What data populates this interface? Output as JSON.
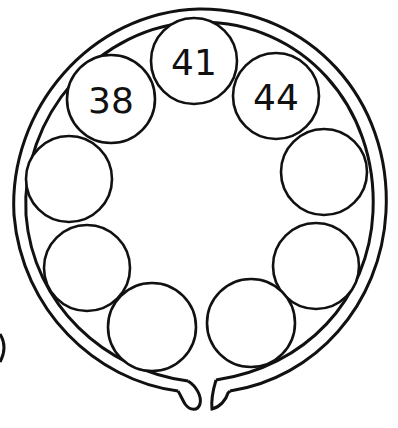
{
  "diagram": {
    "title": "",
    "type": "circular-sequence-puzzle",
    "stroke_color": "#111111",
    "background": "#ffffff",
    "circles": [
      {
        "id": "c1",
        "label": "38",
        "cx": 111,
        "cy": 99,
        "r": 44
      },
      {
        "id": "c2",
        "label": "41",
        "cx": 194,
        "cy": 61,
        "r": 43
      },
      {
        "id": "c3",
        "label": "44",
        "cx": 276,
        "cy": 96,
        "r": 43
      },
      {
        "id": "c4",
        "label": "",
        "cx": 324,
        "cy": 172,
        "r": 43
      },
      {
        "id": "c5",
        "label": "",
        "cx": 316,
        "cy": 266,
        "r": 43
      },
      {
        "id": "c6",
        "label": "",
        "cx": 251,
        "cy": 323,
        "r": 44
      },
      {
        "id": "c7",
        "label": "",
        "cx": 152,
        "cy": 327,
        "r": 44
      },
      {
        "id": "c8",
        "label": "",
        "cx": 87,
        "cy": 268,
        "r": 43
      },
      {
        "id": "c9",
        "label": "",
        "cx": 69,
        "cy": 179,
        "r": 43
      }
    ]
  }
}
